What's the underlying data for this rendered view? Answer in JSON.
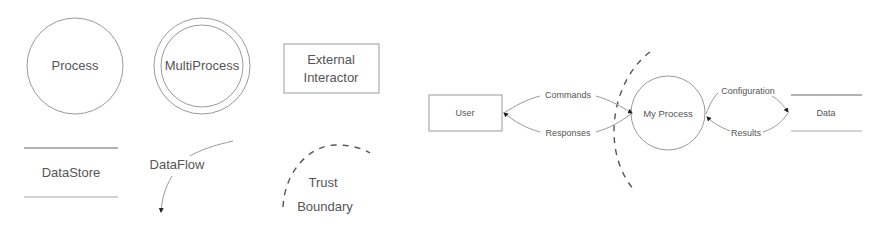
{
  "legend": {
    "process": {
      "label": "Process"
    },
    "multiprocess": {
      "label": "MultiProcess"
    },
    "external_interactor": {
      "line1": "External",
      "line2": "Interactor"
    },
    "datastore": {
      "label": "DataStore"
    },
    "dataflow": {
      "label": "DataFlow"
    },
    "trust_boundary": {
      "line1": "Trust",
      "line2": "Boundary"
    }
  },
  "example": {
    "user": {
      "label": "User"
    },
    "process": {
      "label": "My Process"
    },
    "datastore": {
      "label": "Data"
    },
    "flows": {
      "commands": "Commands",
      "responses": "Responses",
      "configuration": "Configuration",
      "results": "Results"
    }
  },
  "colors": {
    "shape_stroke": "#9a9a9a",
    "text": "#555555",
    "arrowhead": "#222222",
    "boundary": "#555555",
    "background": "#ffffff"
  }
}
